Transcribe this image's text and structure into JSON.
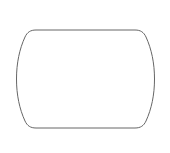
{
  "canvas": {
    "width": "170",
    "height": "153",
    "viewbox": "0 0 170 153",
    "background_color": "#ffffff"
  },
  "shape": {
    "name": "barrel",
    "fill_color": "#ffffff",
    "stroke_color": "#666666",
    "stroke_width": "1",
    "path": "M 36 30 H 135 C 140.5 30 143.8 32.2 146 37 C 151.5 49 154.5 63 154.5 79 C 154.5 95 151.5 109 146 121 C 143.8 125.8 140.5 128 135 128 H 36 C 30.5 128 27.2 125.8 25 121 C 19.5 109 16.5 95 16.5 79 C 16.5 63 19.5 49 25 37 C 27.2 32.2 30.5 30 36 30 Z"
  }
}
